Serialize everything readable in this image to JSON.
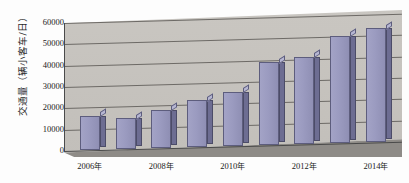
{
  "chart_data": {
    "type": "bar",
    "title": "",
    "xlabel": "",
    "ylabel": "交通量（辆小客车/日）",
    "ylim": [
      0,
      60000
    ],
    "ytick_values": [
      0,
      10000,
      20000,
      30000,
      40000,
      50000,
      60000
    ],
    "ytick_labels": [
      "0",
      "10000",
      "20000",
      "30000",
      "40000",
      "50000",
      "60000"
    ],
    "grid": true,
    "legend": "none",
    "categories": [
      "2006年",
      "2007年",
      "2008年",
      "2009年",
      "2010年",
      "2011年",
      "2012年",
      "2013年",
      "2014年"
    ],
    "xtick_labels": [
      "2006年",
      "2008年",
      "2010年",
      "2012年",
      "2014年"
    ],
    "xtick_category_index": [
      0,
      2,
      4,
      6,
      8
    ],
    "values": [
      16000,
      14500,
      18000,
      22000,
      25500,
      39000,
      41000,
      50500,
      53500
    ],
    "series": [
      {
        "name": "交通量",
        "values": [
          16000,
          14500,
          18000,
          22000,
          25500,
          39000,
          41000,
          50500,
          53500
        ]
      }
    ],
    "style": {
      "bar_face_color": "#9b9bc0",
      "bar_side_color": "#6d6d92",
      "bar_top_color": "#b6b6d2",
      "bar_edge_color": "#5d5d7d",
      "plot_background_color": "#c6c3be",
      "floor_color": "#8e8b87",
      "gridline_color": "#6d6a66",
      "axis_color": "#4a4a4a",
      "text_color": "#1a1a1a",
      "page_background_color": "#fdfdfd"
    }
  }
}
